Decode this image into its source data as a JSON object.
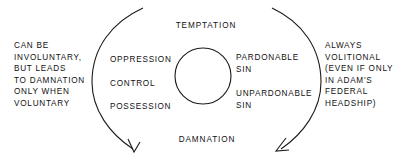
{
  "diagram": {
    "title_top": "TEMPTATION",
    "title_bottom": "DAMNATION",
    "stroke_color": "#1a1a1a",
    "text_color": "#111111",
    "background_color": "#ffffff"
  },
  "left_paragraph": {
    "lines": [
      "CAN BE",
      "INVOLUNTARY,",
      "BUT LEADS",
      "TO DAMNATION",
      "ONLY WHEN",
      "VOLUNTARY"
    ]
  },
  "right_paragraph": {
    "lines": [
      "ALWAYS",
      "VOLITIONAL",
      "(EVEN IF ONLY",
      "IN ADAM'S",
      "FEDERAL",
      "HEADSHIP)"
    ]
  },
  "inner_left_stages": [
    {
      "label": "OPPRESSION"
    },
    {
      "label": "CONTROL"
    },
    {
      "label": "POSSESSION"
    }
  ],
  "inner_right_stages": [
    {
      "lines": [
        "PARDONABLE",
        "SIN"
      ]
    },
    {
      "lines": [
        "UNPARDONABLE",
        "SIN"
      ]
    }
  ],
  "center_circle": {
    "cx": 203,
    "cy": 76,
    "r": 28
  },
  "arrows": {
    "left_arc_name": "left-descending-arc",
    "right_arc_name": "right-descending-arc"
  }
}
